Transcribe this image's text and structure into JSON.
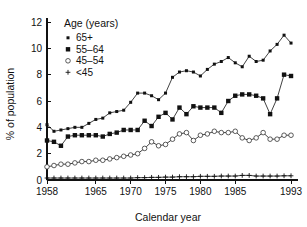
{
  "chart_data": {
    "type": "line",
    "title": "",
    "xlabel": "Calendar year",
    "ylabel": "% of population",
    "xlim": [
      1958,
      1994
    ],
    "ylim": [
      0,
      12
    ],
    "xticks": [
      1958,
      1965,
      1970,
      1975,
      1980,
      1985,
      1993
    ],
    "xtick_labels": [
      "1958",
      "1965",
      "1970",
      "1975",
      "1980",
      "1985",
      "1993"
    ],
    "yticks": [
      0,
      2,
      4,
      6,
      8,
      10,
      12
    ],
    "ytick_labels": [
      "0",
      "2",
      "4",
      "6",
      "8",
      "10",
      "12"
    ],
    "grid": false,
    "legend_position": "top-left-inside",
    "legend_title": "Age (years)",
    "x": [
      1958,
      1959,
      1960,
      1961,
      1962,
      1963,
      1964,
      1965,
      1966,
      1967,
      1968,
      1969,
      1970,
      1971,
      1972,
      1973,
      1974,
      1975,
      1976,
      1977,
      1978,
      1979,
      1980,
      1981,
      1982,
      1983,
      1984,
      1985,
      1986,
      1987,
      1988,
      1989,
      1990,
      1991,
      1992,
      1993
    ],
    "series": [
      {
        "name": "65+",
        "marker": "small-filled-square",
        "values": [
          4.2,
          3.7,
          3.8,
          3.9,
          4.0,
          4.0,
          4.3,
          4.6,
          4.7,
          5.1,
          5.2,
          5.3,
          5.9,
          6.6,
          6.6,
          6.4,
          6.1,
          6.6,
          7.8,
          8.2,
          8.3,
          8.2,
          7.9,
          8.4,
          8.8,
          9.0,
          9.3,
          8.9,
          8.6,
          9.4,
          9.0,
          9.1,
          9.8,
          10.3,
          11.0,
          10.4
        ]
      },
      {
        "name": "55–64",
        "marker": "filled-square",
        "values": [
          3.0,
          2.9,
          2.6,
          3.3,
          3.4,
          3.4,
          3.4,
          3.4,
          3.3,
          3.5,
          3.6,
          3.8,
          3.8,
          3.8,
          4.5,
          4.1,
          4.8,
          5.1,
          4.6,
          5.5,
          5.0,
          5.6,
          5.5,
          5.5,
          5.5,
          5.1,
          6.0,
          6.4,
          6.5,
          6.5,
          6.4,
          6.2,
          5.0,
          6.2,
          8.0,
          7.9
        ]
      },
      {
        "name": "45–54",
        "marker": "open-circle",
        "values": [
          1.0,
          1.1,
          1.2,
          1.2,
          1.3,
          1.4,
          1.4,
          1.5,
          1.5,
          1.6,
          1.7,
          1.8,
          1.9,
          2.0,
          2.4,
          2.9,
          2.6,
          2.7,
          3.1,
          3.5,
          3.6,
          3.0,
          3.4,
          3.5,
          3.7,
          3.6,
          3.6,
          3.7,
          3.2,
          3.0,
          3.2,
          3.6,
          3.1,
          3.1,
          3.4,
          3.4
        ]
      },
      {
        "name": "<45",
        "marker": "plus",
        "values": [
          0.15,
          0.15,
          0.15,
          0.15,
          0.15,
          0.15,
          0.15,
          0.15,
          0.15,
          0.15,
          0.15,
          0.15,
          0.15,
          0.18,
          0.18,
          0.2,
          0.2,
          0.22,
          0.22,
          0.25,
          0.25,
          0.25,
          0.28,
          0.28,
          0.28,
          0.3,
          0.3,
          0.3,
          0.35,
          0.35,
          0.3,
          0.3,
          0.3,
          0.3,
          0.32,
          0.32
        ]
      }
    ],
    "legend_entries": [
      {
        "label": "65+",
        "marker": "small-filled-square"
      },
      {
        "label": "55–64",
        "marker": "filled-square"
      },
      {
        "label": "45–54",
        "marker": "open-circle"
      },
      {
        "label": "<45",
        "marker": "plus"
      }
    ]
  }
}
